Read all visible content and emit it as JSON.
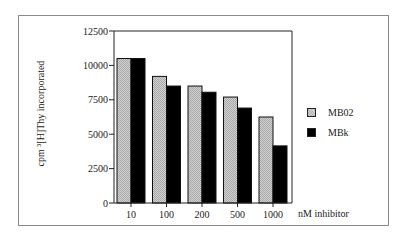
{
  "chart_data": {
    "type": "bar",
    "title": "",
    "xlabel": "nM inhibitor",
    "ylabel": "cpm ³[H]Thy incorporated",
    "categories": [
      "10",
      "100",
      "200",
      "500",
      "1000"
    ],
    "series": [
      {
        "name": "MB02",
        "color": "#c4c4c4",
        "pattern": "stippled gray",
        "values": [
          10500,
          9200,
          8500,
          7700,
          6250
        ]
      },
      {
        "name": "MBk",
        "color": "#000000",
        "pattern": "solid black",
        "values": [
          10500,
          8500,
          8050,
          6900,
          4150
        ]
      }
    ],
    "ylim": [
      0,
      12500
    ],
    "yticks": [
      0,
      2500,
      5000,
      7500,
      10000,
      12500
    ],
    "ytick_labels": [
      "0",
      "2500",
      "5000",
      "7500",
      "10000",
      "12500"
    ],
    "grid": false,
    "legend_position": "right"
  },
  "labels": {
    "ylabel": "cpm ³[H]Thy incorporated",
    "xlabel": "nM inhibitor",
    "legend": [
      "MB02",
      "MBk"
    ]
  }
}
